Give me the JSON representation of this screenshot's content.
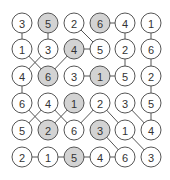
{
  "puzzle": {
    "rows": 6,
    "cols": 6,
    "colors": {
      "shaded": "#d3d3d3",
      "stroke": "#555555",
      "text": "#333333"
    },
    "layout": {
      "col_x": [
        22,
        48,
        74,
        100,
        125,
        151
      ],
      "row_y": [
        23,
        49,
        76,
        103,
        130,
        157
      ],
      "radius": 10
    },
    "grid": [
      [
        3,
        5,
        2,
        6,
        4,
        1
      ],
      [
        1,
        3,
        4,
        5,
        2,
        6
      ],
      [
        4,
        6,
        3,
        1,
        5,
        2
      ],
      [
        6,
        4,
        1,
        2,
        3,
        5
      ],
      [
        5,
        2,
        6,
        3,
        1,
        4
      ],
      [
        2,
        1,
        5,
        4,
        6,
        3
      ]
    ],
    "shaded": [
      [
        0,
        1
      ],
      [
        0,
        3
      ],
      [
        1,
        2
      ],
      [
        2,
        1
      ],
      [
        2,
        3
      ],
      [
        3,
        2
      ],
      [
        4,
        1
      ],
      [
        4,
        3
      ],
      [
        5,
        2
      ]
    ],
    "links": [
      [
        [
          0,
          0
        ],
        [
          1,
          0
        ]
      ],
      [
        [
          0,
          1
        ],
        [
          1,
          1
        ]
      ],
      [
        [
          0,
          2
        ],
        [
          1,
          3
        ]
      ],
      [
        [
          0,
          3
        ],
        [
          0,
          4
        ]
      ],
      [
        [
          0,
          4
        ],
        [
          1,
          4
        ]
      ],
      [
        [
          0,
          5
        ],
        [
          1,
          5
        ]
      ],
      [
        [
          1,
          0
        ],
        [
          2,
          1
        ]
      ],
      [
        [
          1,
          1
        ],
        [
          2,
          0
        ]
      ],
      [
        [
          1,
          2
        ],
        [
          2,
          1
        ]
      ],
      [
        [
          1,
          2
        ],
        [
          1,
          3
        ]
      ],
      [
        [
          1,
          4
        ],
        [
          2,
          4
        ]
      ],
      [
        [
          1,
          5
        ],
        [
          2,
          5
        ]
      ],
      [
        [
          2,
          2
        ],
        [
          2,
          3
        ]
      ],
      [
        [
          2,
          3
        ],
        [
          2,
          4
        ]
      ],
      [
        [
          2,
          0
        ],
        [
          3,
          0
        ]
      ],
      [
        [
          2,
          5
        ],
        [
          3,
          5
        ]
      ],
      [
        [
          3,
          0
        ],
        [
          4,
          1
        ]
      ],
      [
        [
          3,
          1
        ],
        [
          4,
          0
        ]
      ],
      [
        [
          3,
          1
        ],
        [
          4,
          2
        ]
      ],
      [
        [
          3,
          2
        ],
        [
          4,
          1
        ]
      ],
      [
        [
          3,
          3
        ],
        [
          4,
          2
        ]
      ],
      [
        [
          3,
          3
        ],
        [
          4,
          4
        ]
      ],
      [
        [
          3,
          4
        ],
        [
          4,
          5
        ]
      ],
      [
        [
          3,
          5
        ],
        [
          4,
          5
        ]
      ],
      [
        [
          4,
          3
        ],
        [
          5,
          4
        ]
      ],
      [
        [
          4,
          4
        ],
        [
          5,
          5
        ]
      ],
      [
        [
          5,
          0
        ],
        [
          5,
          1
        ]
      ],
      [
        [
          5,
          1
        ],
        [
          5,
          2
        ]
      ],
      [
        [
          5,
          2
        ],
        [
          5,
          3
        ]
      ],
      [
        [
          5,
          3
        ],
        [
          5,
          4
        ]
      ]
    ]
  }
}
